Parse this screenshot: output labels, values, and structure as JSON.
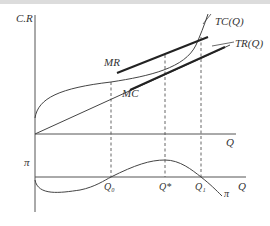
{
  "diagram": {
    "upper_panel": {
      "y_axis_label": "C.R",
      "x_axis_label": "Q",
      "curves": [
        {
          "name": "TC",
          "label": "TC(Q)"
        },
        {
          "name": "TR",
          "label": "TR(Q)"
        }
      ],
      "tangents": [
        {
          "name": "MR",
          "label": "MR"
        },
        {
          "name": "MC",
          "label": "MC"
        }
      ]
    },
    "lower_panel": {
      "y_axis_label": "π",
      "x_axis_label": "Q",
      "curve_label": "π",
      "points": [
        {
          "name": "Q0",
          "label": "Q₀"
        },
        {
          "name": "Qstar",
          "label": "Q*"
        },
        {
          "name": "Q1",
          "label": "Q₁"
        }
      ]
    },
    "colors": {
      "axis": "#555555",
      "curve": "#444444",
      "tangent": "#222222",
      "dashed": "#555555"
    }
  }
}
